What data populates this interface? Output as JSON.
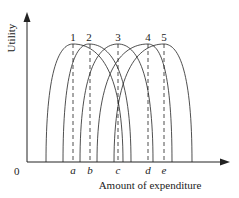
{
  "diagram": {
    "y_axis_label": "Utility",
    "x_axis_label": "Amount of expenditure",
    "origin_label": "0",
    "curves": [
      {
        "label": "1",
        "peak_x": 73,
        "left_x": 46,
        "right_x": 123
      },
      {
        "label": "2",
        "peak_x": 89,
        "left_x": 63,
        "right_x": 131
      },
      {
        "label": "3",
        "peak_x": 118,
        "left_x": 80,
        "right_x": 153
      },
      {
        "label": "4",
        "peak_x": 148,
        "left_x": 97,
        "right_x": 172
      },
      {
        "label": "5",
        "peak_x": 164,
        "left_x": 114,
        "right_x": 192
      }
    ],
    "points": [
      {
        "label": "a",
        "x": 73
      },
      {
        "label": "b",
        "x": 90
      },
      {
        "label": "c",
        "x": 118
      },
      {
        "label": "d",
        "x": 148
      },
      {
        "label": "e",
        "x": 164
      }
    ],
    "colors": {
      "line": "#222222",
      "background": "#ffffff"
    }
  }
}
